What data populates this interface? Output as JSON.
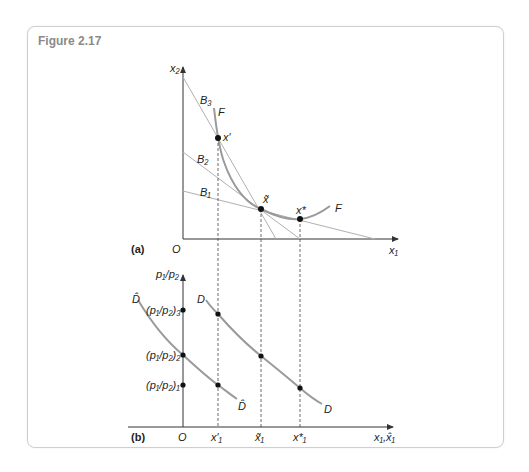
{
  "figure": {
    "title": "Figure 2.17"
  },
  "colors": {
    "axis": "#333333",
    "curve": "#9a9a9a",
    "budget_line": "#b0b0b0",
    "point": "#111111",
    "border": "#cfcfcf",
    "title": "#8a8a8a"
  },
  "panel_a": {
    "label": "(a)",
    "origin_label": "O",
    "y_axis_label": "x₂",
    "x_axis_label": "x₁",
    "budget_lines": [
      {
        "label": "B₃"
      },
      {
        "label": "B₂"
      },
      {
        "label": "B₁"
      }
    ],
    "curve_label_top": "F",
    "curve_label_right": "F",
    "points": [
      {
        "label": "x′"
      },
      {
        "label": "x̃"
      },
      {
        "label": "x*"
      }
    ]
  },
  "panel_b": {
    "label": "(b)",
    "origin_label": "O",
    "y_axis_label": "p₁/p₂",
    "x_axis_label": "x₁,x̂₁",
    "price_levels": [
      {
        "label": "(p₁/p₂)₃"
      },
      {
        "label": "(p₁/p₂)₂"
      },
      {
        "label": "(p₁/p₂)₁"
      }
    ],
    "x_ticks": [
      {
        "label": "x′₁"
      },
      {
        "label": "x̃₁"
      },
      {
        "label": "x*₁"
      }
    ],
    "curves": [
      {
        "name": "D-hat",
        "label_top": "D̂",
        "label_bottom": "D̂"
      },
      {
        "name": "D",
        "label_top": "D",
        "label_bottom": "D"
      }
    ]
  }
}
